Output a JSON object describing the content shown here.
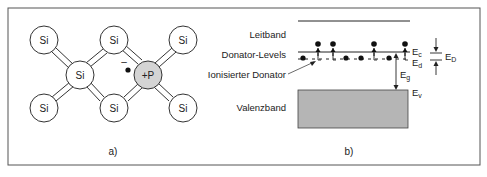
{
  "panel_a": {
    "caption": "a)",
    "atoms": [
      {
        "label": "Si",
        "x": 44,
        "y": 40
      },
      {
        "label": "Si",
        "x": 114,
        "y": 40
      },
      {
        "label": "Si",
        "x": 183,
        "y": 40
      },
      {
        "label": "Si",
        "x": 80,
        "y": 75
      },
      {
        "label": "+P",
        "x": 148,
        "y": 75
      },
      {
        "label": "Si",
        "x": 44,
        "y": 108
      },
      {
        "label": "Si",
        "x": 114,
        "y": 108
      },
      {
        "label": "Si",
        "x": 183,
        "y": 108
      }
    ],
    "free_electron_charge": "–"
  },
  "panel_b": {
    "caption": "b)",
    "labels": {
      "conduction_band": "Leitband",
      "donor_levels": "Donator-Levels",
      "ionized_donor": "Ionisierter Donator",
      "valence_band": "Valenzband"
    },
    "energy_labels": {
      "ec": "E",
      "ec_sub": "c",
      "ed": "E",
      "ed_sub": "d",
      "eg": "E",
      "eg_sub": "g",
      "ev": "E",
      "ev_sub": "v",
      "eD": "E",
      "eD_sub": "D"
    },
    "colors": {
      "valence_band_fill": "#b5b5b5",
      "donor_fill": "#d4d4d4"
    }
  }
}
